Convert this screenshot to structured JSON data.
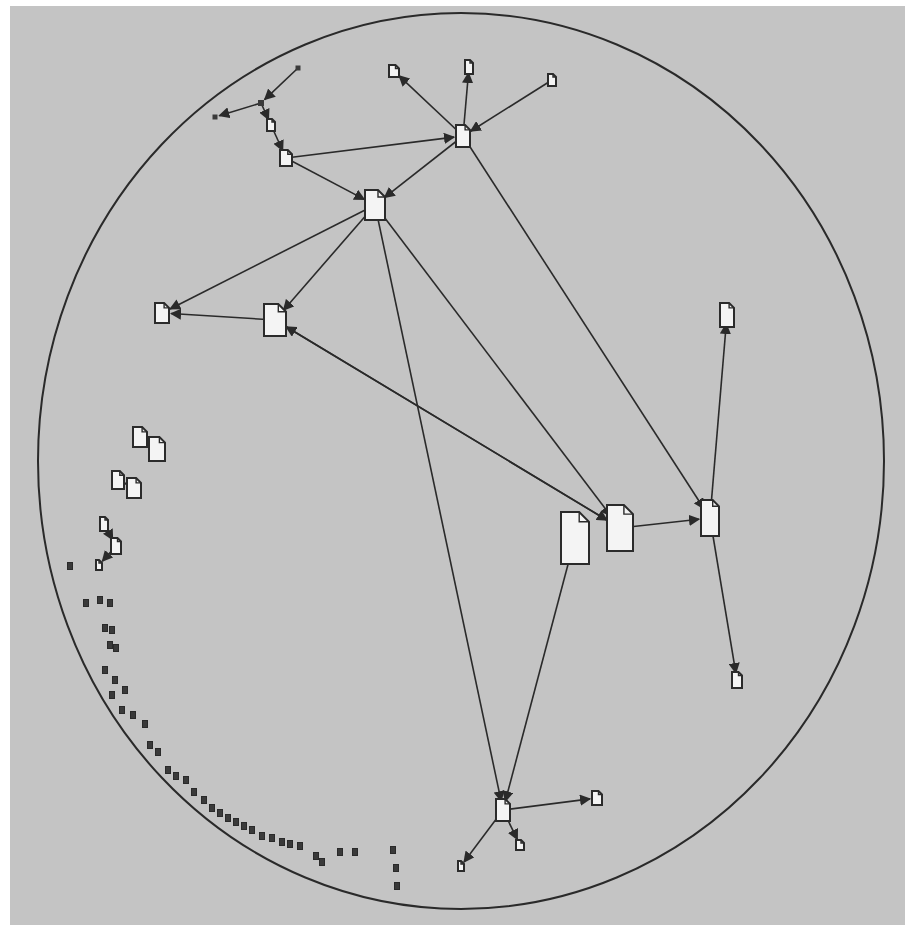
{
  "view": {
    "type": "hyperbolic-document-graph",
    "background": "#c4c4c4",
    "line_color": "#2a2a2a",
    "node_fill": "#f4f4f4",
    "disk": {
      "cx": 461,
      "cy": 461,
      "rx": 423,
      "ry": 448
    }
  },
  "nodes": [
    {
      "id": "n1",
      "x": 375,
      "y": 205,
      "w": 20,
      "h": 30,
      "role": "hub"
    },
    {
      "id": "n2",
      "x": 463,
      "y": 136,
      "w": 14,
      "h": 22,
      "role": "hub"
    },
    {
      "id": "n3",
      "x": 275,
      "y": 320,
      "w": 22,
      "h": 32,
      "role": "document"
    },
    {
      "id": "n4",
      "x": 162,
      "y": 313,
      "w": 14,
      "h": 20,
      "role": "document"
    },
    {
      "id": "n5",
      "x": 575,
      "y": 538,
      "w": 28,
      "h": 52,
      "role": "document"
    },
    {
      "id": "n6",
      "x": 620,
      "y": 528,
      "w": 26,
      "h": 46,
      "role": "document"
    },
    {
      "id": "n7",
      "x": 710,
      "y": 518,
      "w": 18,
      "h": 36,
      "role": "hub"
    },
    {
      "id": "n8",
      "x": 727,
      "y": 315,
      "w": 14,
      "h": 24,
      "role": "document"
    },
    {
      "id": "n9",
      "x": 737,
      "y": 680,
      "w": 10,
      "h": 16,
      "role": "document"
    },
    {
      "id": "n10",
      "x": 503,
      "y": 810,
      "w": 14,
      "h": 22,
      "role": "hub"
    },
    {
      "id": "n11",
      "x": 597,
      "y": 798,
      "w": 10,
      "h": 14,
      "role": "document"
    },
    {
      "id": "n12",
      "x": 520,
      "y": 845,
      "w": 8,
      "h": 10,
      "role": "document"
    },
    {
      "id": "n13",
      "x": 461,
      "y": 866,
      "w": 6,
      "h": 10,
      "role": "document"
    },
    {
      "id": "n14",
      "x": 394,
      "y": 71,
      "w": 10,
      "h": 12,
      "role": "document"
    },
    {
      "id": "n15",
      "x": 469,
      "y": 67,
      "w": 8,
      "h": 14,
      "role": "document"
    },
    {
      "id": "n16",
      "x": 552,
      "y": 80,
      "w": 8,
      "h": 12,
      "role": "document"
    },
    {
      "id": "n17",
      "x": 286,
      "y": 158,
      "w": 12,
      "h": 16,
      "role": "document"
    },
    {
      "id": "n18",
      "x": 271,
      "y": 125,
      "w": 8,
      "h": 12,
      "role": "document"
    },
    {
      "id": "n19",
      "x": 261,
      "y": 103,
      "w": 6,
      "h": 6,
      "role": "junction"
    },
    {
      "id": "n20",
      "x": 215,
      "y": 117,
      "w": 5,
      "h": 5,
      "role": "leaf"
    },
    {
      "id": "n21",
      "x": 298,
      "y": 68,
      "w": 5,
      "h": 5,
      "role": "leaf"
    },
    {
      "id": "n22",
      "x": 140,
      "y": 437,
      "w": 14,
      "h": 20,
      "role": "document"
    },
    {
      "id": "n23",
      "x": 157,
      "y": 449,
      "w": 16,
      "h": 24,
      "role": "document"
    },
    {
      "id": "n24",
      "x": 118,
      "y": 480,
      "w": 12,
      "h": 18,
      "role": "document"
    },
    {
      "id": "n25",
      "x": 134,
      "y": 488,
      "w": 14,
      "h": 20,
      "role": "document"
    },
    {
      "id": "n26",
      "x": 104,
      "y": 524,
      "w": 8,
      "h": 14,
      "role": "document"
    },
    {
      "id": "n27",
      "x": 116,
      "y": 546,
      "w": 10,
      "h": 16,
      "role": "document"
    },
    {
      "id": "n28",
      "x": 99,
      "y": 565,
      "w": 6,
      "h": 10,
      "role": "document"
    }
  ],
  "edges": [
    [
      "n2",
      "n1"
    ],
    [
      "n17",
      "n1"
    ],
    [
      "n1",
      "n4"
    ],
    [
      "n1",
      "n3"
    ],
    [
      "n3",
      "n4"
    ],
    [
      "n3",
      "n6"
    ],
    [
      "n6",
      "n3"
    ],
    [
      "n1",
      "n6"
    ],
    [
      "n1",
      "n10"
    ],
    [
      "n2",
      "n7"
    ],
    [
      "n6",
      "n7"
    ],
    [
      "n7",
      "n8"
    ],
    [
      "n7",
      "n9"
    ],
    [
      "n5",
      "n10"
    ],
    [
      "n10",
      "n11"
    ],
    [
      "n10",
      "n12"
    ],
    [
      "n10",
      "n13"
    ],
    [
      "n2",
      "n14"
    ],
    [
      "n2",
      "n15"
    ],
    [
      "n16",
      "n2"
    ],
    [
      "n17",
      "n2"
    ],
    [
      "n18",
      "n17"
    ],
    [
      "n19",
      "n18"
    ],
    [
      "n19",
      "n20"
    ],
    [
      "n21",
      "n19"
    ],
    [
      "n22",
      "n23"
    ],
    [
      "n24",
      "n25"
    ],
    [
      "n26",
      "n27"
    ],
    [
      "n27",
      "n28"
    ]
  ],
  "peripheral_clusters": [
    {
      "x": 70,
      "y": 566
    },
    {
      "x": 86,
      "y": 603
    },
    {
      "x": 100,
      "y": 600
    },
    {
      "x": 110,
      "y": 603
    },
    {
      "x": 105,
      "y": 628
    },
    {
      "x": 112,
      "y": 630
    },
    {
      "x": 110,
      "y": 645
    },
    {
      "x": 116,
      "y": 648
    },
    {
      "x": 105,
      "y": 670
    },
    {
      "x": 115,
      "y": 680
    },
    {
      "x": 125,
      "y": 690
    },
    {
      "x": 112,
      "y": 695
    },
    {
      "x": 122,
      "y": 710
    },
    {
      "x": 133,
      "y": 715
    },
    {
      "x": 145,
      "y": 724
    },
    {
      "x": 150,
      "y": 745
    },
    {
      "x": 158,
      "y": 752
    },
    {
      "x": 168,
      "y": 770
    },
    {
      "x": 176,
      "y": 776
    },
    {
      "x": 186,
      "y": 780
    },
    {
      "x": 194,
      "y": 792
    },
    {
      "x": 204,
      "y": 800
    },
    {
      "x": 212,
      "y": 808
    },
    {
      "x": 220,
      "y": 813
    },
    {
      "x": 228,
      "y": 818
    },
    {
      "x": 236,
      "y": 822
    },
    {
      "x": 244,
      "y": 826
    },
    {
      "x": 252,
      "y": 830
    },
    {
      "x": 262,
      "y": 836
    },
    {
      "x": 272,
      "y": 838
    },
    {
      "x": 282,
      "y": 842
    },
    {
      "x": 290,
      "y": 844
    },
    {
      "x": 300,
      "y": 846
    },
    {
      "x": 316,
      "y": 856
    },
    {
      "x": 322,
      "y": 862
    },
    {
      "x": 340,
      "y": 852
    },
    {
      "x": 355,
      "y": 852
    },
    {
      "x": 393,
      "y": 850
    },
    {
      "x": 396,
      "y": 868
    },
    {
      "x": 397,
      "y": 886
    }
  ]
}
